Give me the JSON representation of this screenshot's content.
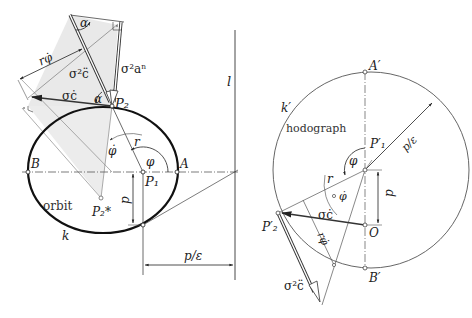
{
  "orbit_diagram": {
    "labels": {
      "alpha_top": "α",
      "alpha_p2": "α",
      "r_phi_dot": "rφ̇",
      "sigma2_cddot": "σ²c̈",
      "sigma2_an": "σ²aⁿ",
      "sigma_cdot": "σċ",
      "P2": "P₂",
      "phi_dot": "φ̇",
      "r": "r",
      "phi": "φ",
      "B": "B",
      "A": "A",
      "P1": "P₁",
      "p": "p",
      "orbit": "orbit",
      "P2_star": "P₂*",
      "k": "k",
      "l": "l",
      "p_over_eps": "p/ε"
    }
  },
  "hodograph_diagram": {
    "labels": {
      "A_prime": "A′",
      "k_prime": "k′",
      "hodograph": "hodograph",
      "P1_prime": "P′₁",
      "p_over_eps": "p/ε",
      "phi": "φ",
      "r": "r",
      "phi_dot": "φ̇",
      "p": "p",
      "P2_prime": "P′₂",
      "sigma_cdot": "σċ",
      "O": "O",
      "r_phi_dot": "rφ̇",
      "B_prime": "B′",
      "sigma2_cddot": "σ²c̈"
    }
  },
  "colors": {
    "line": "#222222",
    "thin": "#555555",
    "shade": "#e6e6e6",
    "vector": "#444444"
  }
}
